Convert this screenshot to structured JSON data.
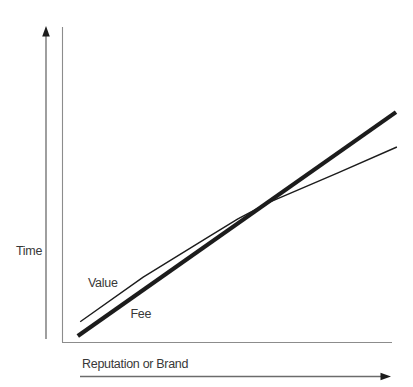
{
  "colors": {
    "ink": "#1c1c1c",
    "frame": "#8c8c8c",
    "arrow_shaft": "#6b6b6b",
    "arrowhead": "#1c1c1c",
    "text": "#383838",
    "background": "#ffffff"
  },
  "chart_data": {
    "type": "line",
    "title": "",
    "xlabel": "Reputation or Brand",
    "ylabel": "Time",
    "axes_numeric": false,
    "gridlines": false,
    "tick_labels": [],
    "legend_position": "inline-labels-on-lines",
    "axis_style": "conceptual axes with solid arrowheads, no ticks or numeric scale",
    "series": [
      {
        "name": "Value",
        "line_weight": "thin",
        "points_norm": [
          [
            0.055,
            0.064
          ],
          [
            0.246,
            0.206
          ],
          [
            0.444,
            0.334
          ],
          [
            0.533,
            0.391
          ],
          [
            0.629,
            0.444
          ],
          [
            0.836,
            0.537
          ],
          [
            1.015,
            0.619
          ]
        ]
      },
      {
        "name": "Fee",
        "line_weight": "thick",
        "points_norm": [
          [
            0.048,
            0.019
          ],
          [
            1.012,
            0.73
          ]
        ]
      }
    ],
    "crossover_point_norm": [
      0.68,
      0.476
    ]
  }
}
